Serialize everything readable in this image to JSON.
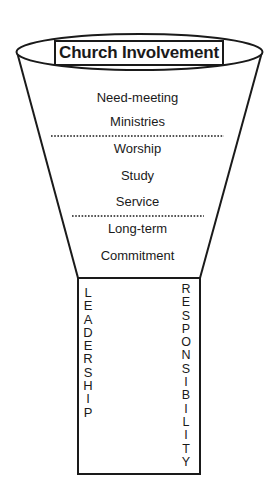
{
  "diagram": {
    "title": "Church Involvement",
    "funnel_sections": [
      {
        "lines": [
          "Need-meeting",
          "Ministries"
        ]
      },
      {
        "lines": [
          "Worship",
          "Study",
          "Service"
        ]
      },
      {
        "lines": [
          "Long-term",
          "Commitment"
        ]
      }
    ],
    "base": {
      "left_word": "LEADERSHIP",
      "left_letters": [
        "L",
        "E",
        "A",
        "D",
        "E",
        "R",
        "S",
        "H",
        "I",
        "P"
      ],
      "right_word": "RESPONSIBILITY",
      "right_letters": [
        "R",
        "E",
        "S",
        "P",
        "O",
        "N",
        "S",
        "I",
        "B",
        "I",
        "L",
        "I",
        "T",
        "Y"
      ]
    },
    "colors": {
      "stroke": "#1a1a1a",
      "background": "#ffffff"
    }
  }
}
